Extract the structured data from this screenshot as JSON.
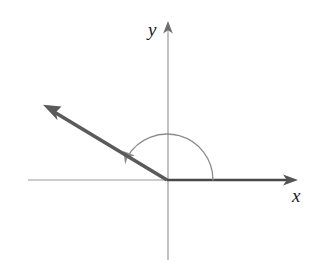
{
  "figure": {
    "name": "angle-in-standard-position",
    "background_color": "#ffffff",
    "width": 322,
    "height": 274
  },
  "axes": {
    "origin": {
      "x": 167,
      "y": 180
    },
    "x_axis": {
      "label": "x",
      "label_position": {
        "x": 292,
        "y": 186
      },
      "line_color": "#9a9a9a",
      "negative_end": {
        "x": 28,
        "y": 180
      },
      "positive_end": {
        "x": 297,
        "y": 180
      },
      "arrow_at": "positive-end"
    },
    "y_axis": {
      "label": "y",
      "label_position": {
        "x": 148,
        "y": 20
      },
      "line_color": "#9a9a9a",
      "negative_end": {
        "x": 168,
        "y": 260
      },
      "positive_end": {
        "x": 168,
        "y": 22
      },
      "arrow_at": "positive-end"
    }
  },
  "angle": {
    "initial_side": {
      "name": "initial-side",
      "from": {
        "x": 167,
        "y": 180
      },
      "to": {
        "x": 297,
        "y": 180
      },
      "color": "#4a4a4a",
      "stroke_width": 3
    },
    "terminal_side": {
      "name": "terminal-side",
      "from": {
        "x": 167,
        "y": 180
      },
      "to": {
        "x": 46,
        "y": 107
      },
      "color": "#5a5a5a",
      "stroke_width": 4,
      "arrow_at": "to",
      "degrees": 149
    },
    "arc": {
      "name": "rotation-arc",
      "center": {
        "x": 167,
        "y": 180
      },
      "radius": 46,
      "start_degrees": 0,
      "end_degrees": 149,
      "direction": "counterclockwise",
      "color": "#8c8c8c",
      "stroke_width": 1.2,
      "arrow_at": "end"
    }
  },
  "colors": {
    "axis_line": "#9a9a9a",
    "ray_dark": "#5a5a5a",
    "initial_side": "#4a4a4a",
    "arc": "#8c8c8c",
    "label_text": "#1c1c1c",
    "background": "#ffffff"
  }
}
